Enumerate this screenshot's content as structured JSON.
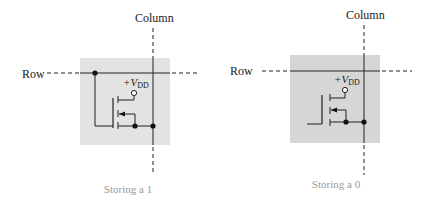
{
  "colors": {
    "cell_fill": "#e3e3e3",
    "cell_fill_dark": "#d6d6d6",
    "line": "#222222",
    "caption": "#9a9a9a"
  },
  "cells": [
    {
      "row_label": "Row",
      "column_label": "Column",
      "supply_label": "+V",
      "supply_sub": "DD",
      "caption": "Storing a 1",
      "row_connected": true
    },
    {
      "row_label": "Row",
      "column_label": "Column",
      "supply_label": "+V",
      "supply_sub": "DD",
      "caption": "Storing a 0",
      "row_connected": false
    }
  ]
}
